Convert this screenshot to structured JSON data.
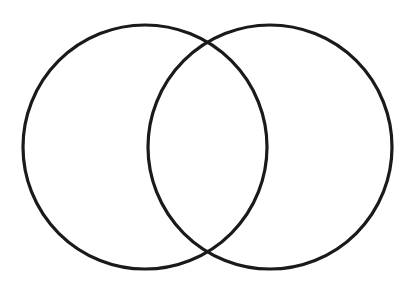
{
  "diagram": {
    "type": "venn",
    "canvas": {
      "width": 409,
      "height": 292,
      "background": "#ffffff"
    },
    "stroke_color": "#1a1a1a",
    "stroke_width": 3.2,
    "circles": [
      {
        "id": "left",
        "cx": 145,
        "cy": 147,
        "r": 122,
        "label": ""
      },
      {
        "id": "right",
        "cx": 270,
        "cy": 147,
        "r": 122,
        "label": ""
      }
    ],
    "labels": []
  }
}
